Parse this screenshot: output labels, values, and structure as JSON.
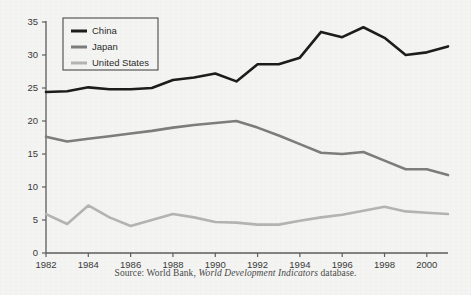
{
  "figure": {
    "source_prefix": "Source: World Bank,",
    "source_italic": "World Development Indicators",
    "source_suffix": "database."
  },
  "colors": {
    "background": "#f4f4f2",
    "axis": "#5d5d5d",
    "china": "#1c1c1c",
    "japan": "#7d7d7d",
    "united_states": "#b4b4b4",
    "legend_border": "#4a4a4a",
    "text": "#2c2c2c"
  },
  "chart_data": {
    "type": "line",
    "title": "",
    "subtitle": "",
    "xlabel": "",
    "ylabel": "",
    "xlim": [
      1982,
      2001
    ],
    "ylim": [
      0,
      35
    ],
    "yticks": [
      0,
      5,
      10,
      15,
      20,
      25,
      30,
      35
    ],
    "ytick_labels": [
      "0",
      "5",
      "10",
      "15",
      "20",
      "25",
      "30",
      "35"
    ],
    "xticks": [
      1982,
      1984,
      1986,
      1988,
      1990,
      1992,
      1994,
      1996,
      1998,
      2000
    ],
    "xtick_labels": [
      "1982",
      "1984",
      "1986",
      "1988",
      "1990",
      "1992",
      "1994",
      "1996",
      "1998",
      "2000"
    ],
    "x": [
      1982,
      1983,
      1984,
      1985,
      1986,
      1987,
      1988,
      1989,
      1990,
      1991,
      1992,
      1993,
      1994,
      1995,
      1996,
      1997,
      1998,
      1999,
      2000,
      2001
    ],
    "grid": false,
    "legend_position": "upper-left",
    "series": [
      {
        "name": "China",
        "color": "#1c1c1c",
        "values": [
          24.4,
          24.5,
          25.1,
          24.8,
          24.8,
          25.0,
          26.2,
          26.6,
          27.2,
          26.0,
          28.6,
          28.6,
          29.6,
          33.5,
          32.7,
          34.2,
          32.6,
          30.0,
          30.4,
          31.3
        ]
      },
      {
        "name": "Japan",
        "color": "#7d7d7d",
        "values": [
          17.6,
          16.9,
          17.3,
          17.7,
          18.1,
          18.5,
          19.0,
          19.4,
          19.7,
          20.0,
          19.0,
          17.8,
          16.5,
          15.2,
          15.0,
          15.3,
          14.0,
          12.7,
          12.7,
          11.8
        ]
      },
      {
        "name": "United States",
        "color": "#b4b4b4",
        "values": [
          5.9,
          4.4,
          7.2,
          5.4,
          4.1,
          5.0,
          5.9,
          5.4,
          4.7,
          4.6,
          4.3,
          4.3,
          4.9,
          5.4,
          5.8,
          6.4,
          7.0,
          6.3,
          6.1,
          5.9
        ]
      }
    ]
  },
  "legend": {
    "items": [
      {
        "label": "China",
        "color": "#1c1c1c"
      },
      {
        "label": "Japan",
        "color": "#7d7d7d"
      },
      {
        "label": "United States",
        "color": "#b4b4b4"
      }
    ]
  }
}
